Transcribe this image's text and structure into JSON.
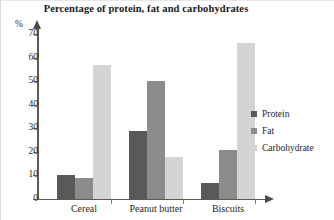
{
  "chart_data": {
    "type": "bar",
    "title": "Percentage of protein, fat and carbohydrates",
    "xlabel": "",
    "ylabel": "%",
    "ylim": [
      0,
      70
    ],
    "yticks": [
      0,
      10,
      20,
      30,
      40,
      50,
      60,
      70
    ],
    "grid": false,
    "legend_position": "right",
    "categories": [
      "Cereal",
      "Peanut butter",
      "Biscuits"
    ],
    "series": [
      {
        "name": "Protein",
        "color": "#595959",
        "values": [
          10,
          29,
          7
        ]
      },
      {
        "name": "Fat",
        "color": "#8c8c8c",
        "values": [
          9,
          50,
          21
        ]
      },
      {
        "name": "Carbohydrate",
        "color": "#d4d4d4",
        "values": [
          57,
          18,
          66
        ]
      }
    ]
  },
  "axis": {
    "unit_label": "%",
    "tick_labels": [
      "70",
      "60",
      "50",
      "40",
      "30",
      "20",
      "10",
      "0"
    ]
  }
}
